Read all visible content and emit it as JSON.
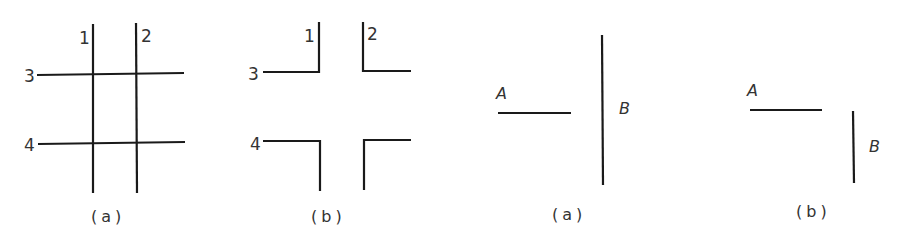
{
  "figures": [
    {
      "id": "fig1a",
      "caption": "(a)",
      "labels": {
        "l1": "1",
        "l2": "2",
        "l3": "3",
        "l4": "4"
      },
      "description": "Two vertical lines (1, 2) crossing two horizontal lines (3, 4)"
    },
    {
      "id": "fig1b",
      "caption": "(b)",
      "labels": {
        "l1": "1",
        "l2": "2",
        "l3": "3",
        "l4": "4"
      },
      "description": "Four L-shaped corners formed by splitting the crossings"
    },
    {
      "id": "fig2a",
      "caption": "(a)",
      "labels": {
        "a": "A",
        "b": "B"
      },
      "description": "Horizontal segment A left of long vertical segment B"
    },
    {
      "id": "fig2b",
      "caption": "(b)",
      "labels": {
        "a": "A",
        "b": "B"
      },
      "description": "Horizontal segment A above-left of short vertical segment B"
    }
  ],
  "colors": {
    "stroke": "#1a1a1a",
    "text": "#333333",
    "background": "#ffffff"
  }
}
